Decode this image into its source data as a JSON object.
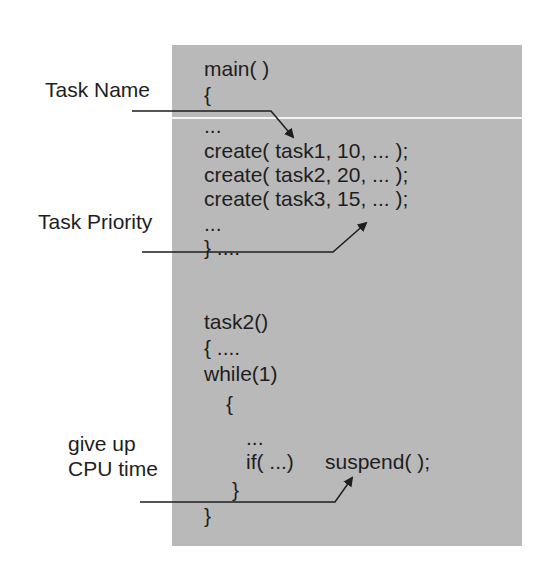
{
  "labels": {
    "task_name": "Task Name",
    "task_priority": "Task Priority",
    "give_up_line1": "give up",
    "give_up_line2": "CPU time"
  },
  "code": {
    "main_sig": "main( )",
    "main_open": "{",
    "ellipsis1": "...",
    "create1": "create( task1, 10, ... );",
    "create2": "create( task2, 20, ... );",
    "create3": "create( task3, 15, ... );",
    "ellipsis2": "...",
    "main_close": "} ....",
    "task2_sig": "task2()",
    "task2_open": "{ ....",
    "while_line": "while(1)",
    "while_open": "{",
    "ellipsis3": "...",
    "if_cond": "if( ...)",
    "suspend_call": "suspend( );",
    "while_close": "}",
    "task2_close": "}"
  },
  "colors": {
    "box_bg": "#b9b9b9",
    "text": "#1e1e1e",
    "arrow": "#1e1e1e"
  }
}
